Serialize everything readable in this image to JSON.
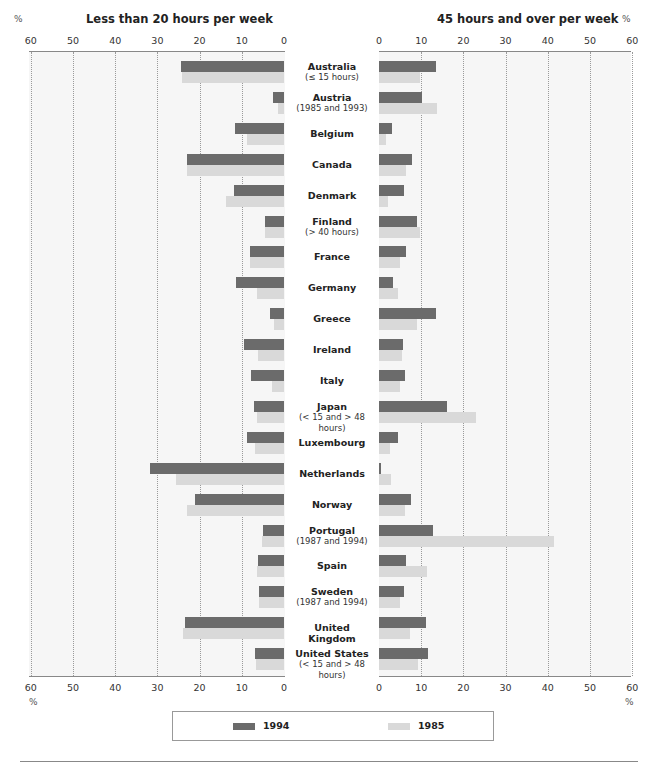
{
  "chart_data": {
    "type": "bar",
    "orientation": "horizontal",
    "layout": "back-to-back (butterfly)",
    "categories": [
      {
        "name": "Australia",
        "note": "(≤ 15 hours)"
      },
      {
        "name": "Austria",
        "note": "(1985 and 1993)"
      },
      {
        "name": "Belgium",
        "note": ""
      },
      {
        "name": "Canada",
        "note": ""
      },
      {
        "name": "Denmark",
        "note": ""
      },
      {
        "name": "Finland",
        "note": "(> 40 hours)"
      },
      {
        "name": "France",
        "note": ""
      },
      {
        "name": "Germany",
        "note": ""
      },
      {
        "name": "Greece",
        "note": ""
      },
      {
        "name": "Ireland",
        "note": ""
      },
      {
        "name": "Italy",
        "note": ""
      },
      {
        "name": "Japan",
        "note": "(< 15 and > 48 hours)"
      },
      {
        "name": "Luxembourg",
        "note": ""
      },
      {
        "name": "Netherlands",
        "note": ""
      },
      {
        "name": "Norway",
        "note": ""
      },
      {
        "name": "Portugal",
        "note": "(1987 and 1994)"
      },
      {
        "name": "Spain",
        "note": ""
      },
      {
        "name": "Sweden",
        "note": "(1987 and 1994)"
      },
      {
        "name": "United Kingdom",
        "note": ""
      },
      {
        "name": "United States",
        "note": "(< 15 and > 48 hours)"
      }
    ],
    "panels": [
      {
        "id": "left",
        "title": "Less than 20 hours per week",
        "unit": "%",
        "direction": "right-to-left",
        "xlim": [
          0,
          60
        ],
        "ticks": [
          "60",
          "50",
          "40",
          "30",
          "20",
          "10",
          "0"
        ],
        "series": [
          {
            "name": "1994",
            "color": "#6b6b6b",
            "values": [
              24.3,
              2.6,
              11.5,
              22.9,
              11.8,
              4.5,
              8.0,
              11.3,
              3.3,
              9.5,
              7.9,
              7.0,
              8.7,
              31.7,
              21.2,
              4.9,
              6.1,
              6.0,
              23.4,
              6.9
            ]
          },
          {
            "name": "1985",
            "color": "#d9d9d9",
            "values": [
              24.1,
              1.5,
              8.7,
              23.1,
              13.8,
              4.5,
              8.0,
              6.4,
              2.3,
              6.1,
              2.8,
              6.4,
              6.9,
              25.7,
              23.0,
              5.1,
              6.5,
              6.0,
              24.0,
              6.7
            ]
          }
        ]
      },
      {
        "id": "right",
        "title": "45 hours and over per week",
        "unit": "%",
        "direction": "left-to-right",
        "xlim": [
          0,
          60
        ],
        "ticks": [
          "0",
          "10",
          "20",
          "30",
          "40",
          "50",
          "60"
        ],
        "series": [
          {
            "name": "1994",
            "color": "#6b6b6b",
            "values": [
              13.6,
              10.3,
              3.0,
              7.8,
              5.9,
              9.0,
              6.4,
              3.2,
              13.4,
              5.7,
              6.1,
              16.2,
              4.4,
              0.5,
              7.7,
              12.8,
              6.3,
              5.9,
              11.2,
              11.5
            ]
          },
          {
            "name": "1985",
            "color": "#d9d9d9",
            "values": [
              9.7,
              13.8,
              1.7,
              6.3,
              2.1,
              9.8,
              4.9,
              4.6,
              9.0,
              5.5,
              4.9,
              23.0,
              2.6,
              2.8,
              6.1,
              41.4,
              11.4,
              4.9,
              7.4,
              9.2
            ]
          }
        ]
      }
    ],
    "legend": [
      {
        "label": "1994",
        "color": "#6b6b6b"
      },
      {
        "label": "1985",
        "color": "#d9d9d9"
      }
    ],
    "legend_position": "bottom-center",
    "grid": "vertical dotted at every 10"
  },
  "header": {
    "left_title": "Less than 20 hours per week",
    "right_title": "45 hours and over per week",
    "pct_symbol": "%"
  },
  "legend": {
    "item_1994": "1994",
    "item_1985": "1985"
  }
}
